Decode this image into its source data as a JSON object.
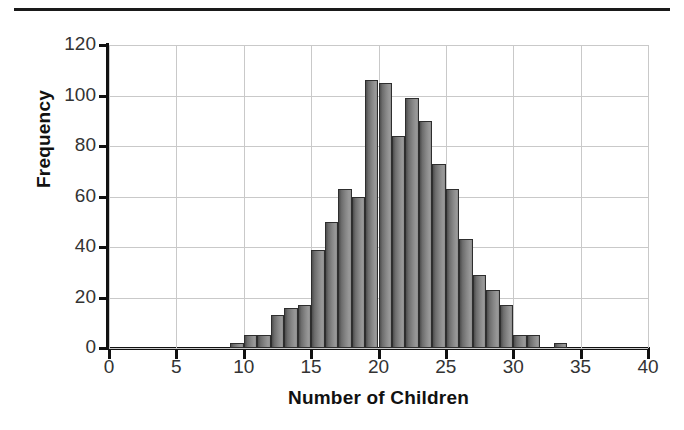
{
  "chart_data": {
    "type": "bar",
    "title": "",
    "subtitle": "",
    "xlabel": "Number of Children",
    "ylabel": "Frequency",
    "xlim": [
      0,
      40
    ],
    "ylim": [
      0,
      120
    ],
    "xticks": [
      "0",
      "5",
      "10",
      "15",
      "20",
      "25",
      "30",
      "35",
      "40"
    ],
    "xtick_values": [
      0,
      5,
      10,
      15,
      20,
      25,
      30,
      35,
      40
    ],
    "yticks": [
      "0",
      "20",
      "40",
      "60",
      "80",
      "100",
      "120"
    ],
    "ytick_values": [
      0,
      20,
      40,
      60,
      80,
      100,
      120
    ],
    "grid": true,
    "grid_axis": "both",
    "legend": null,
    "bin_width": 1,
    "bar_color": "#868686",
    "bar_edge_color": "#2e2e2e",
    "categories": [
      9,
      10,
      11,
      12,
      13,
      14,
      15,
      16,
      17,
      18,
      19,
      20,
      21,
      22,
      23,
      24,
      25,
      26,
      27,
      28,
      29,
      30,
      31,
      33
    ],
    "values": [
      2,
      5,
      5,
      13,
      16,
      17,
      39,
      50,
      63,
      60,
      106,
      105,
      84,
      99,
      90,
      73,
      63,
      43,
      29,
      23,
      17,
      5,
      5,
      2
    ]
  },
  "axis": {
    "y_title": "Frequency",
    "x_title": "Number of Children"
  }
}
